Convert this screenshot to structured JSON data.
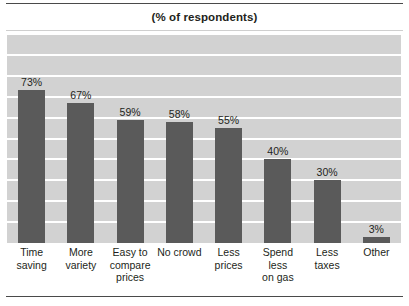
{
  "chart_data": {
    "type": "bar",
    "title": "(% of respondents)",
    "subtitle": "",
    "xlabel": "",
    "ylabel": "",
    "ylim": [
      0,
      100
    ],
    "grid": true,
    "gridlines": [
      0,
      10,
      20,
      30,
      40,
      50,
      60,
      70,
      80,
      90,
      100
    ],
    "legend": "none",
    "categories": [
      "Time saving",
      "More variety",
      "Easy to compare prices",
      "No crowd",
      "Less prices",
      "Spend less on gas",
      "Less taxes",
      "Other"
    ],
    "category_lines": [
      [
        "Time",
        "saving"
      ],
      [
        "More",
        "variety"
      ],
      [
        "Easy to",
        "compare",
        "prices"
      ],
      [
        "No crowd"
      ],
      [
        "Less",
        "prices"
      ],
      [
        "Spend",
        "less",
        "on gas"
      ],
      [
        "Less",
        "taxes"
      ],
      [
        "Other"
      ]
    ],
    "values": [
      73,
      67,
      59,
      58,
      55,
      40,
      30,
      3
    ],
    "data_labels": [
      "73%",
      "67%",
      "59%",
      "58%",
      "55%",
      "40%",
      "30%",
      "3%"
    ],
    "colors": {
      "bar": "#5a5a5a",
      "plot_background": "#d2d2d2",
      "gridline": "#ffffff",
      "text": "#231f20",
      "rule": "#4a4a4a"
    }
  }
}
